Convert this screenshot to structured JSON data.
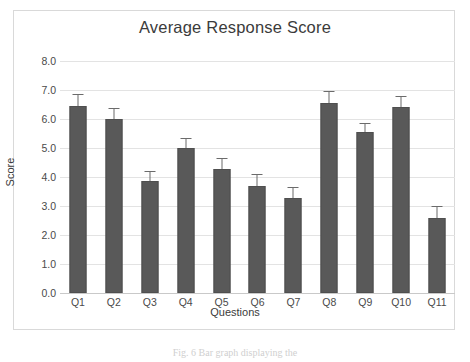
{
  "chart_data": {
    "type": "bar",
    "title": "Average Response Score",
    "xlabel": "Questions",
    "ylabel": "Score",
    "categories": [
      "Q1",
      "Q2",
      "Q3",
      "Q4",
      "Q5",
      "Q6",
      "Q7",
      "Q8",
      "Q9",
      "Q10",
      "Q11"
    ],
    "values": [
      6.45,
      6.0,
      3.87,
      5.0,
      4.27,
      3.7,
      3.28,
      6.55,
      5.55,
      6.4,
      2.57
    ],
    "errors": [
      0.4,
      0.37,
      0.35,
      0.33,
      0.38,
      0.4,
      0.38,
      0.4,
      0.32,
      0.38,
      0.42
    ],
    "ylim": [
      0,
      8
    ],
    "ytick_labels": [
      "0.0",
      "1.0",
      "2.0",
      "3.0",
      "4.0",
      "5.0",
      "6.0",
      "7.0",
      "8.0"
    ],
    "ytick_values": [
      0,
      1,
      2,
      3,
      4,
      5,
      6,
      7,
      8
    ],
    "grid": true,
    "legend": "none",
    "bar_color": "#595959",
    "error_bar_color": "#6b6b6b",
    "gridline_color": "#e3e3e3",
    "has_error_bars": true
  },
  "caption": {
    "text": "Fig. 6  Bar graph displaying the"
  }
}
